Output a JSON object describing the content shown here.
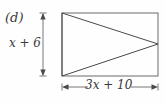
{
  "figure": {
    "part_label": "(d)",
    "height_label": "x + 6",
    "width_label": "3x + 10",
    "shape": "rectangle-with-inscribed-triangle",
    "stroke_color": "#555555",
    "background_color": "#fefefe",
    "rectangle": {
      "left": 62,
      "top": 13,
      "right": 158,
      "bottom": 76
    },
    "triangle": {
      "vertex_top_left": [
        62,
        13
      ],
      "vertex_bottom_left": [
        62,
        76
      ],
      "vertex_apex_right": [
        158,
        44
      ]
    },
    "height_dimension": {
      "axis_x": 43,
      "top_y": 13,
      "bottom_y": 76,
      "arrowheads": "both-ends-inward"
    },
    "width_dimension": {
      "axis_y": 87,
      "left_x": 62,
      "right_x": 158,
      "arrowheads": "both-ends-outward"
    }
  }
}
